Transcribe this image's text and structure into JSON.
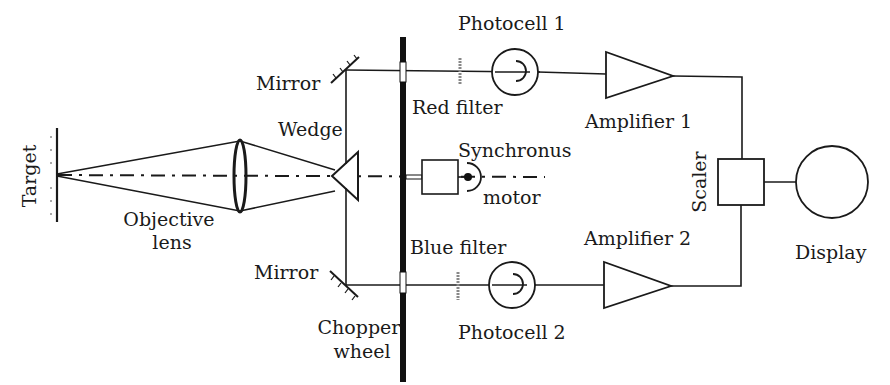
{
  "diagram": {
    "type": "optical-electronic block diagram",
    "labels": {
      "target": "Target",
      "objective_lens": [
        "Objective",
        "lens"
      ],
      "mirror_top": "Mirror",
      "mirror_bottom": "Mirror",
      "wedge": "Wedge",
      "chopper_wheel": [
        "Chopper",
        "wheel"
      ],
      "red_filter": "Red filter",
      "blue_filter": "Blue filter",
      "motor": [
        "Synchronus",
        "motor"
      ],
      "photocell_1": "Photocell 1",
      "photocell_2": "Photocell 2",
      "amplifier_1": "Amplifier 1",
      "amplifier_2": "Amplifier 2",
      "scaler": "Scaler",
      "display": "Display"
    },
    "connections": [
      {
        "from": "Target",
        "to": "Objective lens"
      },
      {
        "from": "Objective lens",
        "to": "Wedge"
      },
      {
        "from": "Wedge",
        "to": "Mirror (top)"
      },
      {
        "from": "Wedge",
        "to": "Mirror (bottom)"
      },
      {
        "from": "Mirror (top)",
        "to": "Red filter",
        "via": "Chopper wheel"
      },
      {
        "from": "Red filter",
        "to": "Photocell 1"
      },
      {
        "from": "Photocell 1",
        "to": "Amplifier 1"
      },
      {
        "from": "Amplifier 1",
        "to": "Scaler"
      },
      {
        "from": "Mirror (bottom)",
        "to": "Blue filter",
        "via": "Chopper wheel"
      },
      {
        "from": "Blue filter",
        "to": "Photocell 2"
      },
      {
        "from": "Photocell 2",
        "to": "Amplifier 2"
      },
      {
        "from": "Amplifier 2",
        "to": "Scaler"
      },
      {
        "from": "Synchronus motor",
        "to": "Chopper wheel"
      },
      {
        "from": "Scaler",
        "to": "Display"
      }
    ]
  }
}
